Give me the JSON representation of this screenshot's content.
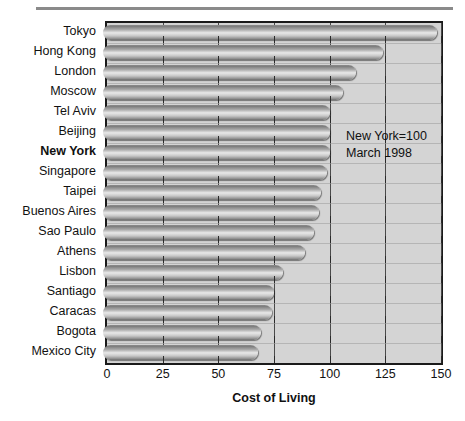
{
  "chart_data": {
    "type": "bar",
    "orientation": "horizontal",
    "title": "",
    "xlabel": "Cost of Living",
    "ylabel": "",
    "xlim": [
      0,
      150
    ],
    "xticks": [
      0,
      25,
      50,
      75,
      100,
      125,
      150
    ],
    "xticklabels": [
      "0",
      "25",
      "50",
      "75",
      "100",
      "125",
      "150"
    ],
    "grid": true,
    "grid_axis": "x",
    "categories": [
      "Tokyo",
      "Hong Kong",
      "London",
      "Moscow",
      "Tel Aviv",
      "Beijing",
      "New York",
      "Singapore",
      "Taipei",
      "Buenos Aires",
      "Sao Paulo",
      "Athens",
      "Lisbon",
      "Santiago",
      "Caracas",
      "Bogota",
      "Mexico City"
    ],
    "values": [
      148,
      124,
      112,
      106,
      100,
      100,
      100,
      99,
      96,
      95,
      93,
      89,
      79,
      75,
      74,
      69,
      68
    ],
    "highlight_category": "New York",
    "annotations": [
      "New York=100",
      "March 1998"
    ]
  },
  "axis": {
    "x_title": "Cost of Living"
  },
  "colors": {
    "plot_background": "#d4d4d4",
    "plot_border": "#1a1a1a",
    "bar_mid": "#e8e8e8",
    "bar_edge": "#6e6e6e",
    "gridline": "#4a4a4a",
    "text": "#111111",
    "top_rule": "#8a8a8a"
  }
}
